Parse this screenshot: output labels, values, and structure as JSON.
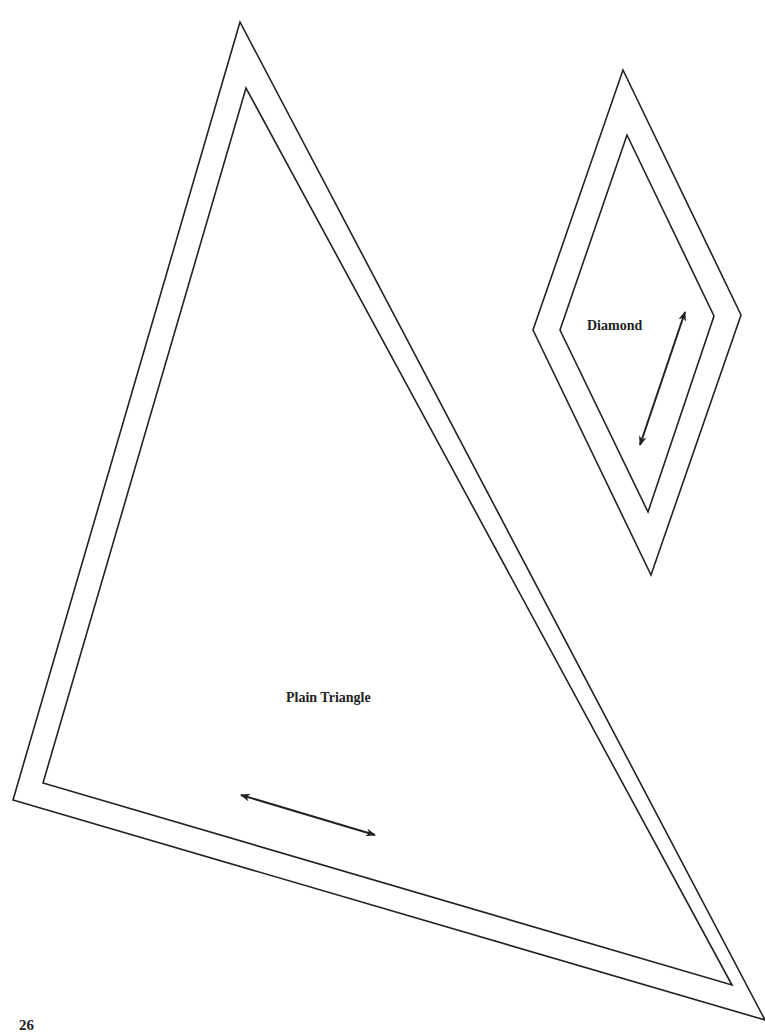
{
  "page": {
    "page_number": "26",
    "background": "#ffffff",
    "line_color": "#222222"
  },
  "shapes": {
    "triangle": {
      "label": "Plain Triangle",
      "outer": [
        [
          240,
          22
        ],
        [
          13,
          800
        ],
        [
          765,
          1020
        ]
      ],
      "inner": [
        [
          246,
          88
        ],
        [
          43,
          783
        ],
        [
          732,
          985
        ]
      ],
      "grain_arrow": {
        "from": [
          241,
          795
        ],
        "to": [
          375,
          835
        ]
      }
    },
    "diamond": {
      "label": "Diamond",
      "outer": [
        [
          623,
          70
        ],
        [
          741,
          315
        ],
        [
          651,
          575
        ],
        [
          533,
          330
        ]
      ],
      "inner": [
        [
          627,
          135
        ],
        [
          714,
          316
        ],
        [
          648,
          512
        ],
        [
          560,
          330
        ]
      ],
      "grain_arrow": {
        "from": [
          685,
          312
        ],
        "to": [
          640,
          445
        ]
      }
    }
  }
}
